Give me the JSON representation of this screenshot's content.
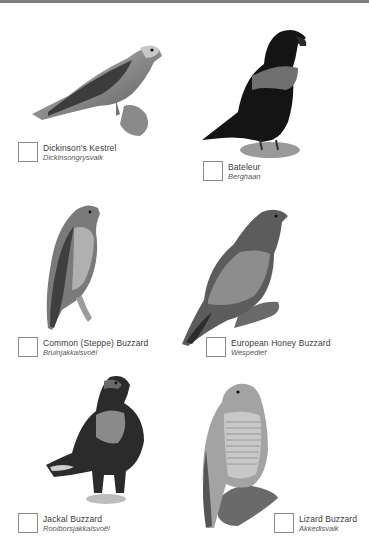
{
  "page": {
    "top_rule_color": "#7d7d7d"
  },
  "birds": [
    {
      "name": "Dickinson's Kestrel",
      "afrikaans": "Dickinsongrysvalk",
      "icon": "kestrel-illustration"
    },
    {
      "name": "Bateleur",
      "afrikaans": "Berghaan",
      "icon": "bateleur-illustration"
    },
    {
      "name": "Common (Steppe) Buzzard",
      "afrikaans": "Bruinjakkalsvoël",
      "icon": "steppe-buzzard-illustration"
    },
    {
      "name": "European Honey Buzzard",
      "afrikaans": "Wespedief",
      "icon": "honey-buzzard-illustration"
    },
    {
      "name": "Jackal Buzzard",
      "afrikaans": "Rooiborsjakkalsvoël",
      "icon": "jackal-buzzard-illustration"
    },
    {
      "name": "Lizard Buzzard",
      "afrikaans": "Akkedisvalk",
      "icon": "lizard-buzzard-illustration"
    }
  ]
}
